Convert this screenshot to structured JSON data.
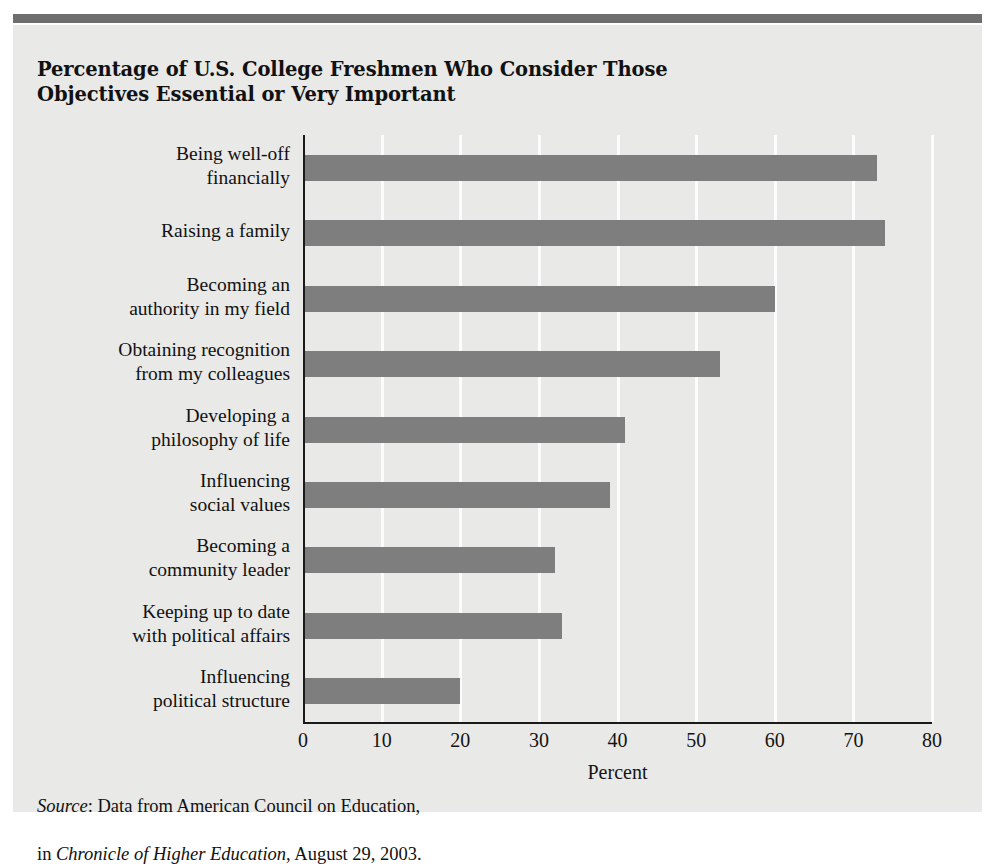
{
  "figure": {
    "title": "Percentage of U.S. College Freshmen Who Consider Those Objectives Essential or Very Important",
    "source_prefix": "Source",
    "source_line1_rest": ": Data from American Council on Education,",
    "source_line2_lead": "in ",
    "source_line2_italic": "Chronicle of Higher Education",
    "source_line2_rest": ", August 29, 2003.",
    "colors": {
      "bar_fill": "#7e7e7e",
      "panel_background": "#e9e9e7",
      "top_rule": "#6e6e6e",
      "gridline": "#fcfcfc",
      "axis_line": "#1a1a1a",
      "text": "#111111"
    }
  },
  "chart_data": {
    "type": "bar",
    "orientation": "horizontal",
    "title": "Percentage of U.S. College Freshmen Who Consider Those Objectives Essential or Very Important",
    "xlabel": "Percent",
    "ylabel": "",
    "xlim": [
      0,
      80
    ],
    "xticks": [
      0,
      10,
      20,
      30,
      40,
      50,
      60,
      70,
      80
    ],
    "xtick_labels": [
      "0",
      "10",
      "20",
      "30",
      "40",
      "50",
      "60",
      "70",
      "80"
    ],
    "grid": "vertical-white",
    "legend": "none",
    "categories": [
      "Being well-off\nfinancially",
      "Raising a family",
      "Becoming an\nauthority in my field",
      "Obtaining recognition\nfrom my colleagues",
      "Developing a\nphilosophy of life",
      "Influencing\nsocial values",
      "Becoming a\ncommunity leader",
      "Keeping up to date\nwith political affairs",
      "Influencing\npolitical structure"
    ],
    "values": [
      73,
      74,
      60,
      53,
      41,
      39,
      32,
      33,
      20
    ]
  }
}
